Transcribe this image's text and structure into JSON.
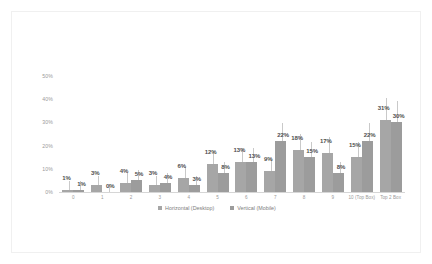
{
  "chart_data": {
    "type": "bar",
    "title": "",
    "subtitle": "",
    "xlabel": "",
    "ylabel": "",
    "ylim": [
      0,
      50
    ],
    "yticks": [
      "0%",
      "10%",
      "20%",
      "30%",
      "40%",
      "50%"
    ],
    "ytick_values": [
      0,
      10,
      20,
      30,
      40,
      50
    ],
    "grid": false,
    "legend_position": "bottom",
    "categories": [
      "0",
      "1",
      "2",
      "3",
      "4",
      "5",
      "6",
      "7",
      "8",
      "9",
      "10 (Top Box)",
      "Top 2 Box"
    ],
    "series": [
      {
        "name": "Horizontal (Desktop)",
        "color": "#a6a6a6",
        "values": [
          1,
          3,
          4,
          3,
          6,
          12,
          13,
          9,
          18,
          17,
          15,
          31
        ],
        "labels": [
          "1%",
          "3%",
          "4%",
          "3%",
          "6%",
          "12%",
          "13%",
          "9%",
          "18%",
          "17%",
          "15%",
          "31%"
        ]
      },
      {
        "name": "Vertical (Mobile)",
        "color": "#9c9c9c",
        "values": [
          1,
          0,
          5,
          4,
          3,
          8,
          13,
          22,
          15,
          8,
          22,
          30
        ],
        "labels": [
          "1%",
          "0%",
          "5%",
          "4%",
          "3%",
          "8%",
          "13%",
          "22%",
          "15%",
          "8%",
          "22%",
          "30%"
        ]
      }
    ]
  },
  "legend": {
    "items": [
      {
        "label": "Horizontal (Desktop)",
        "color": "#a6a6a6"
      },
      {
        "label": "Vertical (Mobile)",
        "color": "#9c9c9c"
      }
    ]
  }
}
